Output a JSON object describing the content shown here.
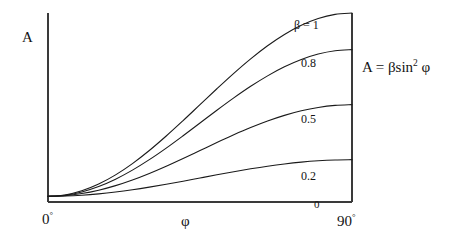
{
  "chart_data": {
    "type": "line",
    "title": "",
    "xlabel": "φ",
    "ylabel": "A",
    "equation": "A = βsin² φ",
    "equation_base": "A = βsin",
    "equation_exponent": "2",
    "equation_tail": "φ",
    "x": [
      0,
      5,
      10,
      15,
      20,
      25,
      30,
      35,
      40,
      45,
      50,
      55,
      60,
      65,
      70,
      75,
      80,
      85,
      90
    ],
    "xlim": [
      0,
      90
    ],
    "ylim": [
      0,
      1
    ],
    "xtick_labels": [
      "0°",
      "90°"
    ],
    "xtick_values": [
      0,
      90
    ],
    "ytick_labels": [],
    "grid": false,
    "legend_position": "inline-right",
    "baseline_offset": 0.03,
    "stray_label": "0",
    "series": [
      {
        "name": "β = 1",
        "beta": 1,
        "label": "β = 1",
        "color": "#1a1a1a",
        "values": [
          0,
          0.0076,
          0.0302,
          0.067,
          0.117,
          0.1786,
          0.25,
          0.329,
          0.4132,
          0.5,
          0.5868,
          0.671,
          0.75,
          0.8214,
          0.883,
          0.933,
          0.9698,
          0.9924,
          1.0
        ]
      },
      {
        "name": "0.8",
        "beta": 0.8,
        "label": "0.8",
        "color": "#1a1a1a",
        "values": [
          0,
          0.0061,
          0.0241,
          0.0536,
          0.0936,
          0.1429,
          0.2,
          0.2632,
          0.3306,
          0.4,
          0.4694,
          0.5368,
          0.6,
          0.6571,
          0.7064,
          0.7464,
          0.7759,
          0.7939,
          0.8
        ]
      },
      {
        "name": "0.5",
        "beta": 0.5,
        "label": "0.5",
        "color": "#1a1a1a",
        "values": [
          0,
          0.0038,
          0.0151,
          0.0335,
          0.0585,
          0.0893,
          0.125,
          0.1645,
          0.2066,
          0.25,
          0.2934,
          0.3355,
          0.375,
          0.4107,
          0.4415,
          0.4665,
          0.4849,
          0.4962,
          0.5
        ]
      },
      {
        "name": "0.2",
        "beta": 0.2,
        "label": "0.2",
        "color": "#1a1a1a",
        "values": [
          0,
          0.0015,
          0.006,
          0.0134,
          0.0234,
          0.0357,
          0.05,
          0.0658,
          0.0826,
          0.1,
          0.1174,
          0.1342,
          0.15,
          0.1643,
          0.1766,
          0.1866,
          0.194,
          0.1985,
          0.2
        ]
      }
    ]
  },
  "labels": {
    "y_axis": "A",
    "x_axis": "φ",
    "x_min": "0",
    "x_min_deg": "°",
    "x_max": "90",
    "x_max_deg": "°",
    "stray_zero": "0",
    "series_1": "β = 1",
    "series_08": "0.8",
    "series_05": "0.5",
    "series_02": "0.2",
    "equation_base": "A = βsin",
    "equation_exponent": "2",
    "equation_tail": "φ"
  },
  "style": {
    "axis_color": "#3a3a3a",
    "curve_color": "#1a1a1a",
    "background": "#ffffff"
  },
  "geometry": {
    "left": 48,
    "right": 352,
    "top": 13,
    "bottom": 202
  }
}
